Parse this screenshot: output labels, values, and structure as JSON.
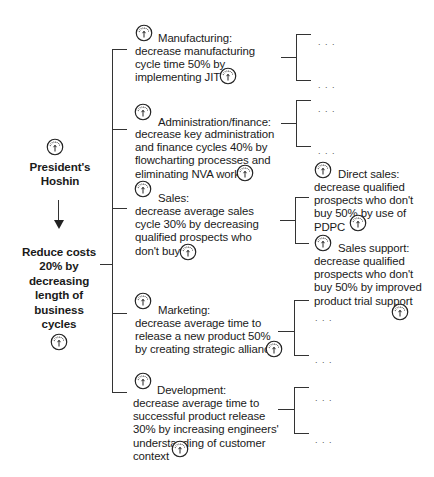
{
  "root": {
    "title": "President's\nHoshin",
    "goal": "Reduce costs\n20% by\ndecreasing\nlength of\nbusiness\ncycles"
  },
  "icons": {
    "gauge": "gauge-icon",
    "arrow": "arrow-down-icon",
    "ellipsis": ". . ."
  },
  "branches": [
    {
      "heading": "Manufacturing:",
      "body": "decrease manufacturing\ncycle time 50% by\nimplementing JIT",
      "children": [
        "...",
        "..."
      ]
    },
    {
      "heading": "Administration/finance:",
      "body": "decrease key administration\nand finance cycles 40% by\nflowcharting processes and\neliminating NVA work",
      "children": [
        "...",
        "..."
      ]
    },
    {
      "heading": "Sales:",
      "body": "decrease average sales\ncycle 30% by decreasing\nqualified prospects who\ndon't buy",
      "children": [
        {
          "heading": "Direct sales:",
          "body": "decrease qualified\nprospects who don't\nbuy 50% by use of\nPDPC"
        },
        {
          "heading": "Sales support:",
          "body": "decrease qualified\nprospects who don't\nbuy 50% by improved\nproduct trial support"
        }
      ]
    },
    {
      "heading": "Marketing:",
      "body": "decrease average time to\nrelease a new product 50%\nby creating strategic alliances",
      "children": [
        "...",
        "..."
      ]
    },
    {
      "heading": "Development:",
      "body": "decrease average time to\nsuccessful product release\n30% by increasing engineers'\nunderstanding of customer\ncontext",
      "children": [
        "...",
        "..."
      ]
    }
  ]
}
